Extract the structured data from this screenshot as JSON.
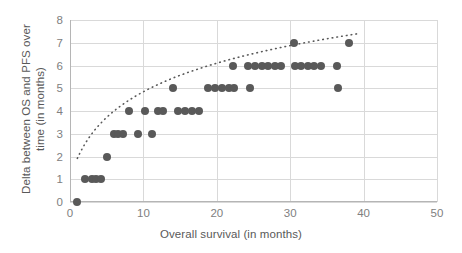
{
  "chart_data": {
    "type": "scatter",
    "title": "",
    "xlabel": "Overall survival (in months)",
    "ylabel": "Delta between OS and PFS over time (in months)",
    "xlim": [
      0,
      50
    ],
    "ylim": [
      0,
      8
    ],
    "xticks": [
      0,
      10,
      20,
      30,
      40,
      50
    ],
    "yticks": [
      0,
      1,
      2,
      3,
      4,
      5,
      6,
      7,
      8
    ],
    "grid": true,
    "legend": "none",
    "marker_color": "#595959",
    "gridline_color": "#d9d9d9",
    "tick_label_color": "#808080",
    "axis_title_color": "#595959",
    "series": [
      {
        "name": "Delta between OS and PFS",
        "marker": "circle",
        "points": [
          [
            1,
            0
          ],
          [
            2,
            1
          ],
          [
            3,
            1
          ],
          [
            3.6,
            1
          ],
          [
            4.2,
            1
          ],
          [
            5,
            2
          ],
          [
            6,
            3
          ],
          [
            6.6,
            3
          ],
          [
            7.2,
            3
          ],
          [
            9.2,
            3
          ],
          [
            11.2,
            3
          ],
          [
            8,
            4
          ],
          [
            10.2,
            4
          ],
          [
            12,
            4
          ],
          [
            12.7,
            4
          ],
          [
            14.7,
            4
          ],
          [
            15.6,
            4
          ],
          [
            16.6,
            4
          ],
          [
            17.6,
            4
          ],
          [
            14,
            5
          ],
          [
            18.8,
            5
          ],
          [
            19.8,
            5
          ],
          [
            20.7,
            5
          ],
          [
            21.6,
            5
          ],
          [
            22.4,
            5
          ],
          [
            24.5,
            5
          ],
          [
            36.5,
            5
          ],
          [
            22.2,
            6
          ],
          [
            24.3,
            6
          ],
          [
            25.2,
            6
          ],
          [
            26.1,
            6
          ],
          [
            27,
            6
          ],
          [
            27.9,
            6
          ],
          [
            28.8,
            6
          ],
          [
            30.6,
            6
          ],
          [
            31.5,
            6
          ],
          [
            32.4,
            6
          ],
          [
            33.3,
            6
          ],
          [
            34.2,
            6
          ],
          [
            36.4,
            6
          ],
          [
            30.5,
            7
          ],
          [
            38,
            7
          ]
        ]
      }
    ],
    "trendline": {
      "style": "dotted",
      "color": "#595959",
      "description": "logarithmic fit rising steeply from origin then flattening near 6"
    }
  }
}
